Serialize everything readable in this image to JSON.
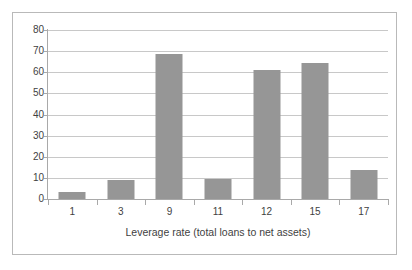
{
  "chart_data": {
    "type": "bar",
    "title": "",
    "subtitle": "",
    "xlabel": "Leverage rate (total loans to net assets)",
    "ylabel": "",
    "categories": [
      "1",
      "3",
      "9",
      "11",
      "12",
      "15",
      "17"
    ],
    "values": [
      3.5,
      9,
      68.5,
      9.5,
      61,
      64.5,
      13.5
    ],
    "series": [
      {
        "name": "",
        "values": [
          3.5,
          9,
          68.5,
          9.5,
          61,
          64.5,
          13.5
        ]
      }
    ],
    "ylim": [
      0,
      80
    ],
    "ytick_labels": [
      "0",
      "10",
      "20",
      "30",
      "40",
      "50",
      "60",
      "70",
      "80"
    ],
    "ytick_values": [
      0,
      10,
      20,
      30,
      40,
      50,
      60,
      70,
      80
    ],
    "grid": true,
    "grid_axis": "y",
    "legend": false,
    "legend_position": "none",
    "colors": {
      "bar": "#969696",
      "gridline": "#c8c8c8",
      "axis": "#a9a9a9",
      "frame": "#b9b9b9",
      "background": "#ffffff",
      "text": "#3f3f3f"
    }
  }
}
